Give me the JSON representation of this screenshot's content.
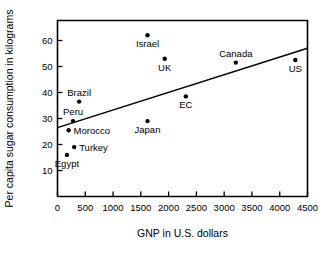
{
  "chart_data": {
    "type": "scatter",
    "title": "",
    "xlabel": "GNP in U.S. dollars",
    "ylabel": "Per capita sugar consumption in kilograms",
    "xlim": [
      0,
      4500
    ],
    "ylim": [
      0,
      68
    ],
    "grid": false,
    "legend": "none",
    "xticks": [
      0,
      500,
      1000,
      1500,
      2000,
      2500,
      3000,
      3500,
      4000,
      4500
    ],
    "xtick_labels": [
      "0",
      "500",
      "1000",
      "1500",
      "2000",
      "2500",
      "3000",
      "3500",
      "4000",
      "4500"
    ],
    "yticks": [
      10,
      20,
      30,
      40,
      50,
      60
    ],
    "ytick_labels": [
      "10",
      "20",
      "30",
      "40",
      "50",
      "60"
    ],
    "points": [
      {
        "label": "Egypt",
        "x": 170,
        "y": 16.0,
        "label_pos": "below"
      },
      {
        "label": "Morocco",
        "x": 200,
        "y": 25.5,
        "label_pos": "right"
      },
      {
        "label": "Peru",
        "x": 280,
        "y": 29.0,
        "label_pos": "above"
      },
      {
        "label": "Turkey",
        "x": 300,
        "y": 19.0,
        "label_pos": "right"
      },
      {
        "label": "Brazil",
        "x": 390,
        "y": 36.5,
        "label_pos": "above"
      },
      {
        "label": "Japan",
        "x": 1620,
        "y": 29.0,
        "label_pos": "below"
      },
      {
        "label": "Israel",
        "x": 1620,
        "y": 62.0,
        "label_pos": "below"
      },
      {
        "label": "UK",
        "x": 1930,
        "y": 53.0,
        "label_pos": "below"
      },
      {
        "label": "EC",
        "x": 2310,
        "y": 38.5,
        "label_pos": "below"
      },
      {
        "label": "Canada",
        "x": 3210,
        "y": 51.5,
        "label_pos": "above"
      },
      {
        "label": "US",
        "x": 4280,
        "y": 52.5,
        "label_pos": "below"
      }
    ],
    "trendline": {
      "x_start": 0,
      "y_start": 26.5,
      "x_end": 4500,
      "y_end": 57.0
    },
    "marker_color": "#000000",
    "line_color": "#000000",
    "axis_color": "#000000",
    "background_color": "#ffffff"
  }
}
